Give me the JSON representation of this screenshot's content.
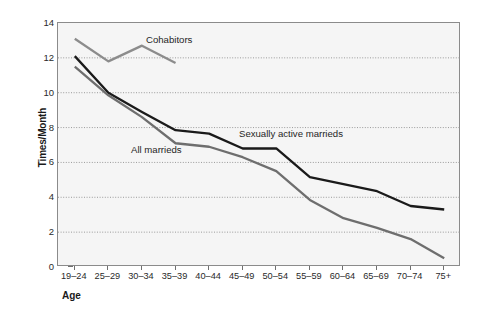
{
  "chart_data": {
    "type": "line",
    "title": "",
    "xlabel": "Age",
    "ylabel": "Times/Month",
    "categories": [
      "19–24",
      "25–29",
      "30–34",
      "35–39",
      "40–44",
      "45–49",
      "50–54",
      "55–59",
      "60–64",
      "65–69",
      "70–74",
      "75+"
    ],
    "ylim": [
      0,
      14
    ],
    "yticks": [
      0,
      2,
      4,
      6,
      8,
      10,
      12,
      14
    ],
    "grid": "horizontal-dotted",
    "legend": "inline-annotations",
    "series": [
      {
        "name": "Cohabitors",
        "color": "#8c8c8c",
        "values": [
          13.1,
          11.8,
          12.7,
          11.7,
          null,
          null,
          null,
          null,
          null,
          null,
          null,
          null
        ]
      },
      {
        "name": "Sexually active marrieds",
        "color": "#1a1a1a",
        "values": [
          12.1,
          10.0,
          8.9,
          7.85,
          7.65,
          6.8,
          6.8,
          5.15,
          4.75,
          4.35,
          3.5,
          3.3
        ]
      },
      {
        "name": "All marrieds",
        "color": "#6e6e6e",
        "values": [
          11.5,
          9.85,
          8.6,
          7.1,
          6.9,
          6.3,
          5.5,
          3.85,
          2.8,
          2.25,
          1.6,
          0.5
        ]
      }
    ]
  },
  "annotations": {
    "cohabitors": "Cohabitors",
    "all_marrieds": "All marrieds",
    "sexually_active_marrieds": "Sexually active marrieds"
  },
  "axes": {
    "x_title": "Age",
    "y_title": "Times/Month"
  }
}
